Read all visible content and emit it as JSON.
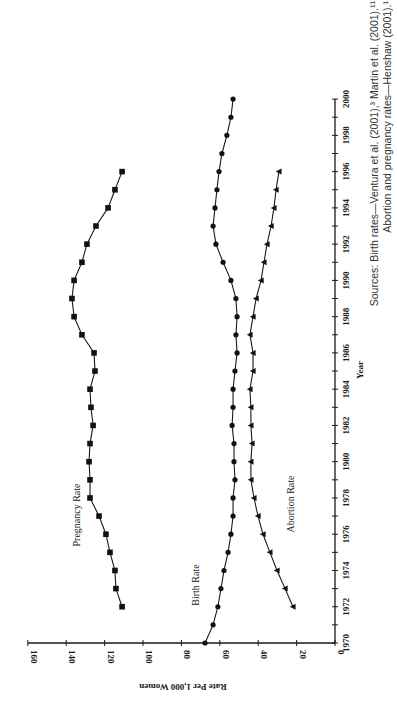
{
  "chart_data": {
    "type": "line",
    "orientation": "rotated 90deg counterclockwise (page rotated)",
    "title": "",
    "xlabel": "Year",
    "ylabel": "Rate Per 1,000 Women",
    "xlim": [
      1970,
      2000
    ],
    "ylim": [
      0,
      160
    ],
    "x_ticks": [
      "1970",
      "1972",
      "1974",
      "1976",
      "1978",
      "1980",
      "1982",
      "1984",
      "1986",
      "1988",
      "1990",
      "1992",
      "1994",
      "1996",
      "1998",
      "2000"
    ],
    "y_ticks": [
      "0",
      "20",
      "40",
      "60",
      "80",
      "100",
      "120",
      "140",
      "160"
    ],
    "grid": false,
    "legend": "inline labels",
    "series": [
      {
        "name": "Pregnancy Rate",
        "marker": "square",
        "x": [
          1972,
          1973,
          1974,
          1975,
          1976,
          1977,
          1978,
          1979,
          1980,
          1981,
          1982,
          1983,
          1984,
          1985,
          1986,
          1987,
          1988,
          1989,
          1990,
          1991,
          1992,
          1993,
          1994,
          1995,
          1996
        ],
        "values": [
          110.9,
          114.1,
          114.6,
          117.2,
          119.3,
          122.9,
          127.6,
          127.6,
          128.1,
          127.6,
          126.0,
          127.1,
          127.6,
          125.0,
          125.5,
          131.8,
          135.9,
          137.0,
          135.9,
          131.8,
          129.2,
          124.5,
          118.2,
          114.6,
          110.9
        ]
      },
      {
        "name": "Birth Rate",
        "marker": "circle",
        "x": [
          1970,
          1971,
          1972,
          1973,
          1974,
          1975,
          1976,
          1977,
          1978,
          1979,
          1980,
          1981,
          1982,
          1983,
          1984,
          1985,
          1986,
          1987,
          1988,
          1989,
          1990,
          1991,
          1992,
          1993,
          1994,
          1995,
          1996,
          1997,
          1998,
          1999,
          2000
        ],
        "values": [
          67.7,
          63.5,
          61.0,
          59.4,
          57.8,
          55.7,
          54.2,
          53.1,
          53.1,
          52.1,
          52.6,
          52.6,
          53.6,
          53.1,
          53.1,
          52.1,
          51.0,
          51.6,
          51.0,
          51.6,
          54.2,
          58.3,
          62.0,
          63.5,
          62.5,
          61.5,
          60.4,
          58.9,
          56.3,
          54.2,
          53.1
        ]
      },
      {
        "name": "Abortion Rate",
        "marker": "triangle",
        "x": [
          1972,
          1973,
          1974,
          1975,
          1976,
          1977,
          1978,
          1979,
          1980,
          1981,
          1982,
          1983,
          1984,
          1985,
          1986,
          1987,
          1988,
          1989,
          1990,
          1991,
          1992,
          1993,
          1994,
          1995,
          1996
        ],
        "values": [
          21.9,
          26.0,
          30.2,
          33.9,
          37.5,
          40.1,
          42.2,
          43.8,
          43.8,
          43.2,
          43.8,
          43.8,
          44.3,
          42.7,
          42.7,
          44.3,
          42.7,
          41.1,
          38.5,
          37.0,
          35.4,
          33.3,
          31.8,
          30.7,
          29.2
        ]
      }
    ],
    "annotations": [
      "Pregnancy Rate",
      "Birth Rate",
      "Abortion Rate"
    ],
    "source_note": "Sources: Birth rates—Ventura et al. (2001),³ Martin et al. (2001).¹¹ Abortion and pregnancy rates—Henshaw (2001).¹"
  },
  "labels": {
    "xlabel": "Year",
    "ylabel": "Rate Per 1,000 Women",
    "pregnancy": "Pregnancy Rate",
    "birth": "Birth Rate",
    "abortion": "Abortion Rate",
    "source_line1": "Sources: Birth rates—Ventura et al. (2001),³ Martin et al. (2001).¹¹",
    "source_line2": "Abortion and pregnancy rates—Henshaw (2001).¹"
  },
  "colors": {
    "ink": "#1a1a1a",
    "background": "#ffffff"
  }
}
